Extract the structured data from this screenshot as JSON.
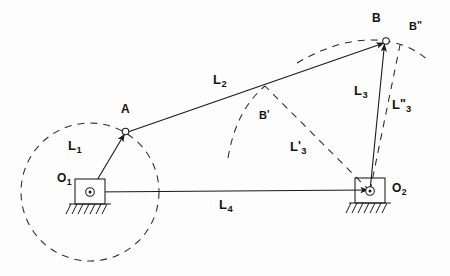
{
  "diagram": {
    "type": "kinematic-linkage-schematic",
    "colors": {
      "background": "#fdfdfd",
      "stroke": "#1a1a1a",
      "dashed": "#2a2a2a",
      "text": "#141414"
    },
    "points": [
      {
        "id": "O1",
        "base": "O",
        "sub": "1",
        "prime": "",
        "x": 90,
        "y": 192,
        "kind": "fixed-pivot"
      },
      {
        "id": "O2",
        "base": "O",
        "sub": "2",
        "prime": "",
        "x": 370,
        "y": 191,
        "kind": "fixed-pivot"
      },
      {
        "id": "A",
        "base": "A",
        "sub": "",
        "prime": "",
        "x": 125,
        "y": 133,
        "kind": "moving-joint"
      },
      {
        "id": "B",
        "base": "B",
        "sub": "",
        "prime": "",
        "x": 385,
        "y": 42,
        "kind": "moving-joint"
      },
      {
        "id": "Bp",
        "base": "B",
        "sub": "",
        "prime": "'",
        "x": 265,
        "y": 87,
        "kind": "alternate-position"
      },
      {
        "id": "Bpp",
        "base": "B",
        "sub": "",
        "prime": "\"",
        "x": 400,
        "y": 44,
        "kind": "alternate-position"
      }
    ],
    "vectors": [
      {
        "id": "L1",
        "base": "L",
        "sub": "1",
        "prime": "",
        "from": "O1",
        "to": "A",
        "style": "solid",
        "label_x": 68,
        "label_y": 139
      },
      {
        "id": "L2",
        "base": "L",
        "sub": "2",
        "prime": "",
        "from": "A",
        "to": "B",
        "style": "solid",
        "label_x": 213,
        "label_y": 73
      },
      {
        "id": "L3",
        "base": "L",
        "sub": "3",
        "prime": "",
        "from": "O2",
        "to": "B",
        "style": "solid",
        "label_x": 354,
        "label_y": 84
      },
      {
        "id": "L4",
        "base": "L",
        "sub": "4",
        "prime": "",
        "from": "O1",
        "to": "O2",
        "style": "solid",
        "label_x": 219,
        "label_y": 198
      },
      {
        "id": "L3p",
        "base": "L",
        "sub": "3",
        "prime": "'",
        "from": "O2",
        "to": "Bp",
        "style": "dashed",
        "label_x": 290,
        "label_y": 140
      },
      {
        "id": "L3pp",
        "base": "L",
        "sub": "3",
        "prime": "\"",
        "from": "O2",
        "to": "Bpp",
        "style": "dashed",
        "label_x": 392,
        "label_y": 100
      }
    ],
    "arcs": [
      {
        "id": "crank-circle",
        "center": "O1",
        "radius": 69,
        "style": "dashed",
        "kind": "full-circle",
        "desc": "locus of point A about fixed pivot O1"
      },
      {
        "id": "rocker-arc-B",
        "center": "O2",
        "radius": 150,
        "style": "dashed",
        "kind": "arc",
        "desc": "locus of point B about fixed pivot O2"
      },
      {
        "id": "coupler-arc-Bprime",
        "center": "A",
        "radius": 0,
        "style": "dashed",
        "kind": "arc",
        "desc": "coupler arc through B-prime"
      }
    ],
    "ground_symbols": [
      {
        "at": "O1",
        "hatch_count": 7,
        "desc": "ground hatching under fixed pivot O1"
      },
      {
        "at": "O2",
        "hatch_count": 7,
        "desc": "ground hatching under fixed pivot O2"
      }
    ],
    "labels": {
      "O1": {
        "base": "O",
        "sub": "1"
      },
      "O2": {
        "base": "O",
        "sub": "2"
      },
      "A": {
        "base": "A"
      },
      "B": {
        "base": "B"
      },
      "Bprime": {
        "base": "B",
        "prime": "'"
      },
      "Bdprime": {
        "base": "B",
        "prime": "\""
      },
      "L1": {
        "base": "L",
        "sub": "1"
      },
      "L2": {
        "base": "L",
        "sub": "2"
      },
      "L3": {
        "base": "L",
        "sub": "3"
      },
      "L4": {
        "base": "L",
        "sub": "4"
      },
      "L3prime": {
        "base": "L",
        "prime": "'",
        "sub": "3"
      },
      "L3dprime": {
        "base": "L",
        "prime": "\"",
        "sub": "3"
      }
    }
  }
}
